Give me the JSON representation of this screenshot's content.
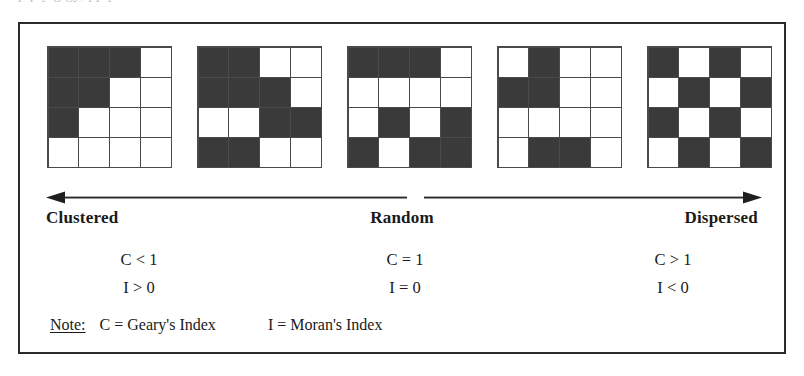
{
  "figure": {
    "top_bleed_text": "p    p                       y   g      gy,              pp                      p",
    "grids": [
      {
        "name": "clustered-grid",
        "rows": [
          [
            "dark",
            "dark",
            "dark",
            "light"
          ],
          [
            "dark",
            "dark",
            "light",
            "light"
          ],
          [
            "dark",
            "light",
            "light",
            "light"
          ],
          [
            "light",
            "light",
            "light",
            "light"
          ]
        ]
      },
      {
        "name": "clustered-mid-grid",
        "rows": [
          [
            "dark",
            "dark",
            "light",
            "light"
          ],
          [
            "dark",
            "dark",
            "dark",
            "light"
          ],
          [
            "light",
            "light",
            "dark",
            "dark"
          ],
          [
            "dark",
            "dark",
            "light",
            "light"
          ]
        ]
      },
      {
        "name": "random-grid",
        "rows": [
          [
            "dark",
            "dark",
            "dark",
            "light"
          ],
          [
            "light",
            "light",
            "light",
            "light"
          ],
          [
            "light",
            "dark",
            "light",
            "dark"
          ],
          [
            "dark",
            "light",
            "dark",
            "dark"
          ]
        ]
      },
      {
        "name": "dispersed-mid-grid",
        "rows": [
          [
            "light",
            "dark",
            "light",
            "light"
          ],
          [
            "dark",
            "dark",
            "light",
            "light"
          ],
          [
            "light",
            "light",
            "light",
            "light"
          ],
          [
            "light",
            "dark",
            "dark",
            "light"
          ]
        ]
      },
      {
        "name": "dispersed-grid",
        "rows": [
          [
            "dark",
            "light",
            "dark",
            "light"
          ],
          [
            "light",
            "dark",
            "light",
            "dark"
          ],
          [
            "dark",
            "light",
            "dark",
            "light"
          ],
          [
            "light",
            "dark",
            "light",
            "dark"
          ]
        ]
      }
    ],
    "axis": {
      "left_label": "Clustered",
      "center_label": "Random",
      "right_label": "Dispersed"
    },
    "stats": [
      {
        "geary": "C < 1",
        "moran": "I > 0"
      },
      {
        "geary": "C = 1",
        "moran": "I = 0"
      },
      {
        "geary": "C > 1",
        "moran": "I < 0"
      }
    ],
    "note": {
      "label": "Note:",
      "geary": "C = Geary's Index",
      "moran": "I = Moran's Index"
    },
    "colors": {
      "dark_cell": "#3a3a3a",
      "light_cell": "#ffffff",
      "grid_line": "#4a4a4a",
      "border": "#2b2b2b",
      "text": "#1a1a1a"
    }
  },
  "chart_data": {
    "type": "diagram",
    "x": [
      "Clustered",
      "Random",
      "Dispersed"
    ],
    "series": [
      {
        "name": "Geary's Index (C)",
        "values": [
          "C < 1",
          "C = 1",
          "C > 1"
        ]
      },
      {
        "name": "Moran's Index (I)",
        "values": [
          "I > 0",
          "I = 0",
          "I < 0"
        ]
      }
    ],
    "grid_dark_cell_counts": [
      6,
      9,
      9,
      5,
      8
    ],
    "legend": [
      "C = Geary's Index",
      "I = Moran's Index"
    ],
    "legend_position": "bottom-left",
    "grid": false
  }
}
